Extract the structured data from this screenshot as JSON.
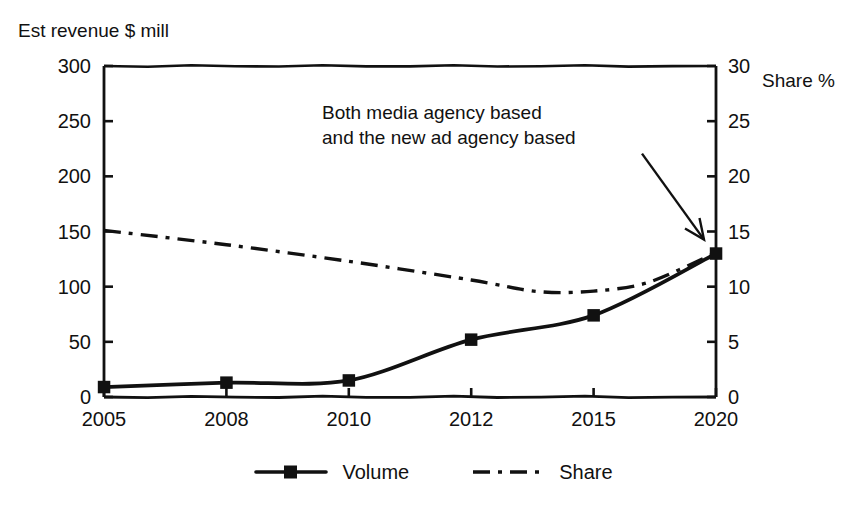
{
  "chart_data": {
    "type": "line",
    "title": "",
    "xlabel": "",
    "ylabel": "Est revenue $ mill",
    "y2label": "Share %",
    "categories": [
      "2005",
      "2008",
      "2010",
      "2012",
      "2015",
      "2020"
    ],
    "ylim": [
      0,
      300
    ],
    "y2lim": [
      0,
      30
    ],
    "yticks": [
      "0",
      "50",
      "100",
      "150",
      "200",
      "250",
      "300"
    ],
    "y2ticks": [
      "0",
      "5",
      "10",
      "15",
      "20",
      "25",
      "30"
    ],
    "grid": false,
    "legend_position": "bottom",
    "series": [
      {
        "name": "Volume",
        "axis": "left",
        "style": "solid-square-markers",
        "values": [
          9,
          13,
          15,
          52,
          74,
          130
        ]
      },
      {
        "name": "Share",
        "axis": "right",
        "style": "dash-dot",
        "values": [
          15.1,
          13.8,
          12.3,
          10.6,
          9.6,
          13.1
        ],
        "note": "declines to a minimum of about 9.5 near 2013-2014 then rises to meet the Volume line at 2020"
      }
    ],
    "annotations": [
      {
        "text_line_1": "Both media agency based",
        "text_line_2": "and the new ad agency based",
        "points_to": "2020 data point"
      }
    ]
  },
  "axes": {
    "left_title": "Est revenue $ mill",
    "right_title": "Share %"
  },
  "legend": {
    "items": [
      {
        "label": "Volume"
      },
      {
        "label": "Share"
      }
    ]
  },
  "annotation": {
    "line1": "Both media agency based",
    "line2": "and the new ad agency based"
  },
  "colors": {
    "ink": "#111111",
    "background": "#ffffff"
  }
}
